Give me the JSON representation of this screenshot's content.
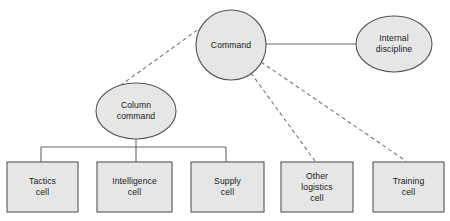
{
  "diagram": {
    "type": "organisational-hierarchy",
    "width": 450,
    "height": 221,
    "background_color": "#ffffff",
    "node_fill_color": "#e6e6e6",
    "node_border_color": "#555555",
    "solid_edge_color": "#666666",
    "dashed_edge_color": "#777777",
    "text_color": "#1a1a1a"
  },
  "nodes": {
    "command": {
      "label": "Command",
      "shape": "circle",
      "cx": 231,
      "cy": 45,
      "r": 35
    },
    "internal_discipline": {
      "label": "Internal\ndiscipline",
      "shape": "ellipse",
      "cx": 394,
      "cy": 44,
      "rx": 38,
      "ry": 28
    },
    "column_command": {
      "label": "Column\ncommand",
      "shape": "ellipse",
      "cx": 136,
      "cy": 111,
      "rx": 40,
      "ry": 28
    },
    "tactics_cell": {
      "label": "Tactics\ncell",
      "shape": "rect",
      "x": 7,
      "y": 162,
      "w": 71,
      "h": 50
    },
    "intelligence_cell": {
      "label": "Intelligence\ncell",
      "shape": "rect",
      "x": 97,
      "y": 162,
      "w": 75,
      "h": 50
    },
    "supply_cell": {
      "label": "Supply\ncell",
      "shape": "rect",
      "x": 191,
      "y": 162,
      "w": 73,
      "h": 50
    },
    "other_logistics_cell": {
      "label": "Other\nlogistics\ncell",
      "shape": "rect",
      "x": 281,
      "y": 162,
      "w": 72,
      "h": 50
    },
    "training_cell": {
      "label": "Training\ncell",
      "shape": "rect",
      "x": 373,
      "y": 162,
      "w": 71,
      "h": 50
    }
  },
  "edges": [
    {
      "from": "command",
      "to": "internal_discipline",
      "style": "solid"
    },
    {
      "from": "command",
      "to": "column_command",
      "style": "dashed"
    },
    {
      "from": "command",
      "to": "other_logistics_cell",
      "style": "dashed"
    },
    {
      "from": "command",
      "to": "training_cell",
      "style": "dashed"
    },
    {
      "from": "column_command",
      "to": "tactics_cell",
      "style": "solid"
    },
    {
      "from": "column_command",
      "to": "intelligence_cell",
      "style": "solid"
    },
    {
      "from": "column_command",
      "to": "supply_cell",
      "style": "solid"
    }
  ]
}
